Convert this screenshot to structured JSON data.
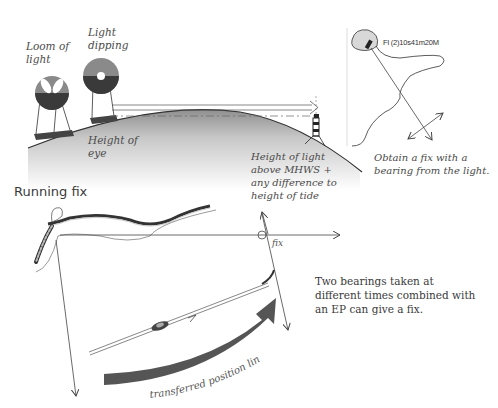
{
  "top_diagram": {
    "labels": {
      "loom_of_light": "Loom of\nlight",
      "light_dipping": "Light\ndipping",
      "height_of_eye": "Height of\neye",
      "height_of_light": "Height of light\nabove MHWS +\nany difference to\nheight of tide"
    },
    "colors": {
      "upper_half": "#8a8a8a",
      "lower_half": "#3a3a3a",
      "hill_shade": "#6a6a6a"
    }
  },
  "chart_inset": {
    "light_characteristic": "Fl (2)10s41m20M",
    "caption": "Obtain a fix with a\nbearing from the light."
  },
  "running_fix": {
    "heading": "Running fix",
    "fix_label": "fix",
    "transferred_label": "transferred position line",
    "caption": "Two bearings taken at\ndifferent times combined with\nan EP can give a fix.",
    "colors": {
      "arrow": "#555555",
      "lines": "#444444"
    }
  }
}
